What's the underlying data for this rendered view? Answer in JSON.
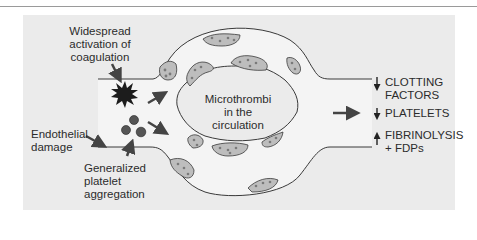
{
  "figure": {
    "topic": "Disseminated intravascular coagulation",
    "colors": {
      "background": "#ebebeb",
      "vessel_lumen": "#f4f4f4",
      "outline": "#3a3a3a",
      "thrombus_fill": "#bdbdbd",
      "arrow": "#444444",
      "text": "#2b2b2b"
    },
    "causes": [
      {
        "id": "coagulation",
        "label": "Widespread\nactivation of\ncoagulation",
        "icon": "starburst-icon"
      },
      {
        "id": "endothelial",
        "label": "Endothelial\ndamage",
        "icon": "arrow-icon"
      },
      {
        "id": "platelet",
        "label": "Generalized\nplatelet\naggregation",
        "icon": "platelet-cluster-icon"
      }
    ],
    "center_label": "Microthrombi\nin the\ncirculation",
    "outcomes": [
      {
        "direction": "down",
        "label": "CLOTTING\nFACTORS"
      },
      {
        "direction": "down",
        "label": "PLATELETS"
      },
      {
        "direction": "up",
        "label": "FIBRINOLYSIS\n+  FDPs"
      }
    ]
  }
}
